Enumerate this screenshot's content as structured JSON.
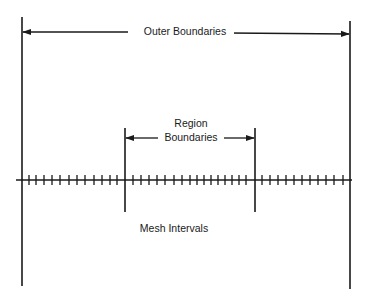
{
  "diagram": {
    "labels": {
      "outer_boundaries": "Outer Boundaries",
      "region_line1": "Region",
      "region_line2": "Boundaries",
      "mesh_intervals": "Mesh Intervals"
    },
    "colors": {
      "line": "#1a1a1a",
      "background": "#ffffff"
    },
    "outer_boundaries": {
      "left_x": 22,
      "right_x": 350,
      "left_y_range": [
        17,
        286
      ],
      "right_y_range": [
        21,
        289
      ],
      "arrow_y": 33
    },
    "region_boundaries": {
      "left_x": 125,
      "right_x": 255,
      "y_range": [
        128,
        212
      ],
      "arrow_y": 138
    },
    "mesh_line": {
      "y": 180,
      "x_range": [
        16,
        352
      ],
      "ticks_left_section": [
        29,
        36,
        44,
        52,
        60,
        69,
        77,
        85,
        94,
        102,
        110,
        117
      ],
      "ticks_middle_section": [
        133,
        141,
        149,
        157,
        165,
        174,
        182,
        190,
        197,
        204,
        211,
        218,
        225,
        232,
        239,
        246
      ],
      "ticks_right_section": [
        262,
        270,
        278,
        286,
        294,
        302,
        310,
        318,
        326,
        334,
        343
      ]
    }
  }
}
